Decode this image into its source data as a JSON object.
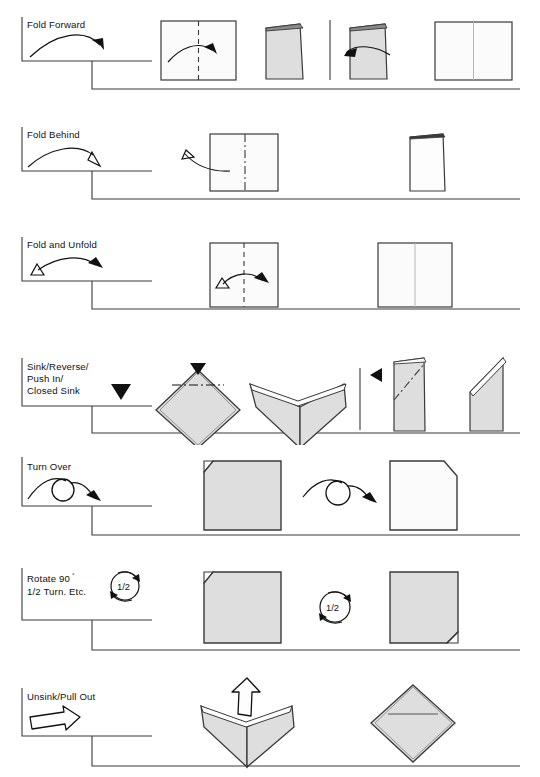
{
  "document": {
    "title": "Origami Symbols Reference Chart",
    "background_color": "#ffffff",
    "line_color": "#3a3a3a",
    "ink_color": "#111111",
    "paper_shaded_fill": "#dedede",
    "paper_white_fill": "#fbfbfb",
    "width": 540,
    "height": 777
  },
  "rows": [
    {
      "id": "fold-forward",
      "label": "Fold Forward",
      "label_lines": [
        "Fold Forward"
      ],
      "arrow_symbol": "solid-arrow-curved",
      "crease_style": "dashed",
      "has_divider": true,
      "steps": [
        {
          "name": "square-with-valley-crease",
          "fill": "white"
        },
        {
          "name": "folded-half-rectangle",
          "fill": "shaded"
        },
        {
          "name": "folded-half-rectangle-unfolding",
          "fill": "shaded"
        },
        {
          "name": "square-with-crease-line",
          "fill": "white"
        }
      ]
    },
    {
      "id": "fold-behind",
      "label": "Fold Behind",
      "label_lines": [
        "Fold Behind"
      ],
      "arrow_symbol": "hollow-arrowhead-curved",
      "crease_style": "dash-dot",
      "has_divider": false,
      "steps": [
        {
          "name": "square-with-mountain-crease",
          "fill": "white"
        },
        {
          "name": "folded-half-rectangle-behind",
          "fill": "white"
        }
      ]
    },
    {
      "id": "fold-and-unfold",
      "label": "Fold and Unfold",
      "label_lines": [
        "Fold and Unfold"
      ],
      "arrow_symbol": "double-headed-arrow-open-triangle",
      "crease_style": "dashed",
      "has_divider": false,
      "steps": [
        {
          "name": "square-with-valley-crease-both-ways",
          "fill": "white"
        },
        {
          "name": "square-with-crease-mark",
          "fill": "white"
        }
      ]
    },
    {
      "id": "sink-reverse",
      "label": "Sink/Reverse/ Push In/ Closed Sink",
      "label_lines": [
        "Sink/Reverse/",
        "Push In/",
        "Closed Sink"
      ],
      "arrow_symbol": "solid-black-triangle",
      "crease_style": "dash-dot",
      "has_divider": true,
      "steps": [
        {
          "name": "diamond-with-sink-crease",
          "fill": "shaded"
        },
        {
          "name": "diamond-sunk-top",
          "fill": "shaded"
        },
        {
          "name": "folded-flap-with-reverse-crease",
          "fill": "shaded"
        },
        {
          "name": "flap-reversed",
          "fill": "shaded"
        }
      ]
    },
    {
      "id": "turn-over",
      "label": "Turn Over",
      "label_lines": [
        "Turn Over"
      ],
      "arrow_symbol": "loop-arrow",
      "crease_style": "none",
      "has_divider": false,
      "steps": [
        {
          "name": "shaded-square-corner-folded-top-left",
          "fill": "shaded"
        },
        {
          "name": "white-square-corner-cut-top-right",
          "fill": "white"
        }
      ]
    },
    {
      "id": "rotate",
      "label": "Rotate 90° 1/2 Turn. Etc.",
      "label_lines": [
        "Rotate 90°",
        "1/2 Turn. Etc."
      ],
      "arrow_symbol": "circular-rotation-arrow",
      "rotation_badge": "1/2",
      "crease_style": "none",
      "has_divider": false,
      "steps": [
        {
          "name": "shaded-square-corner-folded-top-left",
          "fill": "shaded"
        },
        {
          "name": "shaded-square-corner-folded-bottom-right",
          "fill": "shaded"
        }
      ]
    },
    {
      "id": "unsink-pull-out",
      "label": "Unsink/Pull Out",
      "label_lines": [
        "Unsink/Pull Out"
      ],
      "arrow_symbol": "hollow-block-arrow",
      "crease_style": "none",
      "has_divider": false,
      "steps": [
        {
          "name": "diamond-with-pull-out-arrow",
          "fill": "shaded"
        },
        {
          "name": "diamond-unsunk",
          "fill": "shaded"
        }
      ]
    }
  ],
  "rotation_badges": {
    "legend": "1/2",
    "step": "1/2"
  },
  "degree_symbol": "°",
  "rotate_text": {
    "line1_main": "Rotate 90",
    "line1_sup": "°",
    "line2": "1/2 Turn. Etc."
  }
}
